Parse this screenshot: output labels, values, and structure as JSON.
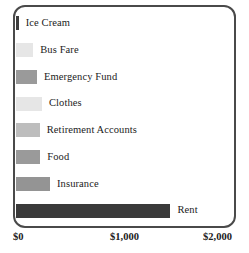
{
  "chart_data": {
    "type": "bar",
    "orientation": "horizontal",
    "title": "",
    "subtitle": "",
    "xlabel": "",
    "ylabel": "",
    "xlim": [
      0,
      2000
    ],
    "grid": false,
    "legend": "none",
    "categories": [
      "Ice Cream",
      "Bus Fare",
      "Emergency Fund",
      "Clothes",
      "Retirement Accounts",
      "Food",
      "Insurance",
      "Rent"
    ],
    "values": [
      25,
      160,
      195,
      240,
      220,
      225,
      315,
      1430
    ],
    "bar_colors": [
      "#3d3d3d",
      "#e6e6e6",
      "#9a9a9a",
      "#e6e6e6",
      "#bdbdbd",
      "#9a9a9a",
      "#949494",
      "#3a3a3a"
    ],
    "xticks": [
      0,
      1000,
      2000
    ],
    "xticklabels": [
      "$0",
      "$1,000",
      "$2,000"
    ],
    "bars": [
      {
        "label": "Ice Cream",
        "value": 25,
        "color": "#3d3d3d"
      },
      {
        "label": "Bus Fare",
        "value": 160,
        "color": "#e6e6e6"
      },
      {
        "label": "Emergency Fund",
        "value": 195,
        "color": "#9a9a9a"
      },
      {
        "label": "Clothes",
        "value": 240,
        "color": "#e6e6e6"
      },
      {
        "label": "Retirement Accounts",
        "value": 220,
        "color": "#bdbdbd"
      },
      {
        "label": "Food",
        "value": 225,
        "color": "#9a9a9a"
      },
      {
        "label": "Insurance",
        "value": 315,
        "color": "#949494"
      },
      {
        "label": "Rent",
        "value": 1430,
        "color": "#3a3a3a"
      }
    ]
  },
  "axis": {
    "tick_0": "$0",
    "tick_1000": "$1,000",
    "tick_2000": "$2,000"
  }
}
